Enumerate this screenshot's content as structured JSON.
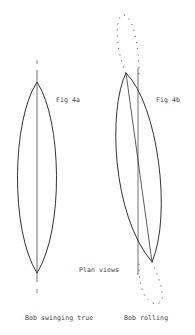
{
  "figures": {
    "fig4a": {
      "label": "Fig 4a",
      "caption": "Bob swinging true"
    },
    "fig4b": {
      "label": "Fig 4b",
      "caption": "Bob rolling"
    }
  },
  "annotation": {
    "plan_views": "Plan views"
  },
  "colors": {
    "stroke": "#333333",
    "background": "#ffffff"
  }
}
